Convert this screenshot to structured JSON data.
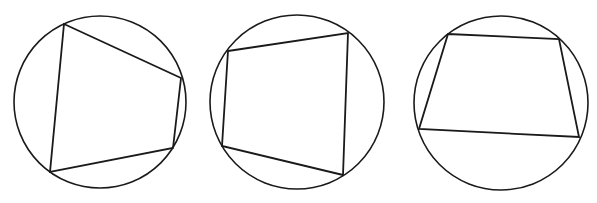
{
  "figure": {
    "stroke_color": "#1a1a1a",
    "background": "#ffffff",
    "panels": [
      {
        "id": "panel-1",
        "circle": {
          "cx": 100,
          "cy": 102,
          "r": 86
        },
        "quadrilateral": [
          [
            64,
            24
          ],
          [
            181,
            78
          ],
          [
            173,
            148
          ],
          [
            50,
            172
          ]
        ]
      },
      {
        "id": "panel-2",
        "circle": {
          "cx": 297,
          "cy": 102,
          "r": 87
        },
        "quadrilateral": [
          [
            228,
            51
          ],
          [
            348,
            33
          ],
          [
            343,
            175
          ],
          [
            222,
            146
          ]
        ]
      },
      {
        "id": "panel-3",
        "circle": {
          "cx": 501,
          "cy": 103,
          "r": 87
        },
        "quadrilateral": [
          [
            448,
            34
          ],
          [
            559,
            39
          ],
          [
            579,
            137
          ],
          [
            419,
            129
          ]
        ]
      }
    ]
  }
}
